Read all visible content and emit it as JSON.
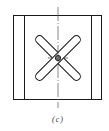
{
  "figure": {
    "caption": "(c)",
    "stroke_color": "#1a1a1a",
    "centerline_color": "#555555",
    "background": "#ffffff",
    "elements": [
      {
        "name": "outer-rectangle",
        "shape": "rect"
      },
      {
        "name": "left-inner-line",
        "shape": "line"
      },
      {
        "name": "right-inner-line",
        "shape": "line"
      },
      {
        "name": "diagonal-slot-1",
        "shape": "rounded-slot"
      },
      {
        "name": "diagonal-slot-2",
        "shape": "rounded-slot"
      },
      {
        "name": "center-hole",
        "shape": "circle"
      },
      {
        "name": "vertical-centerline",
        "shape": "dash-dot-line"
      }
    ]
  }
}
